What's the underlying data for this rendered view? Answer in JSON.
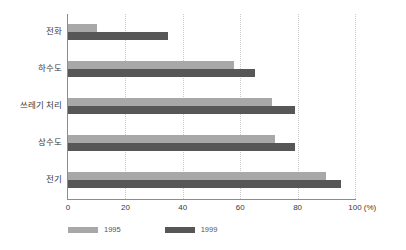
{
  "chart_data": {
    "type": "bar",
    "orientation": "horizontal",
    "title": "",
    "xlabel": "(%)",
    "ylabel": "",
    "categories": [
      "전화",
      "하수도",
      "쓰레기 처리",
      "상수도",
      "전기"
    ],
    "series": [
      {
        "name": "1995",
        "color": "#a8a8a8",
        "values": [
          10,
          58,
          71,
          72,
          90
        ]
      },
      {
        "name": "1999",
        "color": "#575757",
        "values": [
          35,
          65,
          79,
          79,
          95
        ]
      }
    ],
    "xlim": [
      0,
      100
    ],
    "xticks": [
      0,
      20,
      40,
      60,
      80,
      100
    ],
    "xtick_labels": [
      "0",
      "20",
      "40",
      "60",
      "80",
      "100"
    ],
    "unit": "(%)",
    "grid": true,
    "grid_axis": "x",
    "grid_style": "dotted",
    "legend_position": "bottom-left"
  },
  "legend": {
    "items": [
      {
        "label": "1995",
        "color": "#a8a8a8"
      },
      {
        "label": "1999",
        "color": "#575757"
      }
    ]
  },
  "colors": {
    "background": "#ffffff",
    "axis": "#8d8d8d",
    "gridline": "#c9c9c9",
    "text": "#3a3a3a",
    "series_1995": "#a8a8a8",
    "series_1999": "#575757"
  }
}
